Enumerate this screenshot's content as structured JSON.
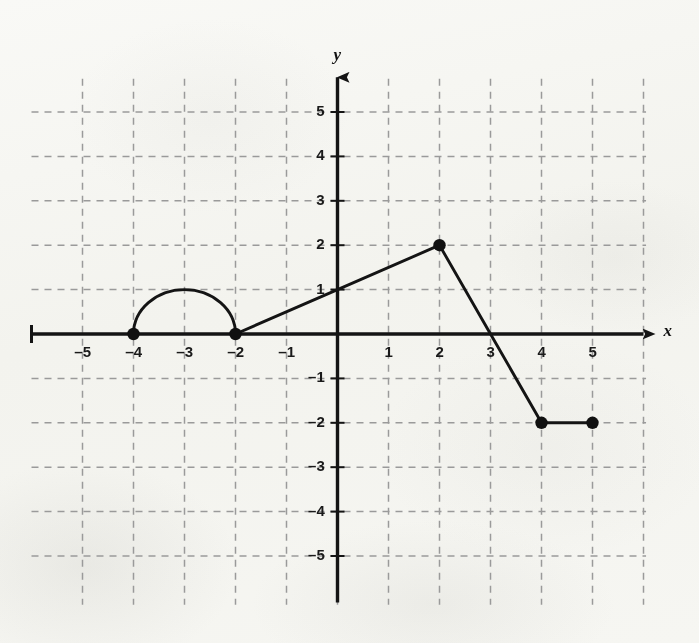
{
  "figure": {
    "background_color": "#fbfbf9",
    "ink_color": "#1a1a1a",
    "grid_color": "#9a9a9a",
    "axis_label_x": "x",
    "axis_label_y": "y"
  },
  "chart_data": {
    "type": "line",
    "title": "",
    "xlabel": "x",
    "ylabel": "y",
    "xlim": [
      -5.7,
      6.2
    ],
    "ylim": [
      -5.6,
      5.9
    ],
    "grid": true,
    "grid_style": "dashed",
    "legend": "none",
    "x_ticks": [
      -5,
      -4,
      -3,
      -2,
      -1,
      1,
      2,
      3,
      4,
      5
    ],
    "x_tick_labels": [
      "–5",
      "–4",
      "–3",
      "–2",
      "–1",
      "1",
      "2",
      "3",
      "4",
      "5"
    ],
    "y_ticks": [
      -5,
      -4,
      -3,
      -2,
      -1,
      1,
      2,
      3,
      4,
      5
    ],
    "y_tick_labels": [
      "–5",
      "–4",
      "–3",
      "–2",
      "–1",
      "1",
      "2",
      "3",
      "4",
      "5"
    ],
    "x_gridlines": [
      -5,
      -4,
      -3,
      -2,
      -1,
      0,
      1,
      2,
      3,
      4,
      5,
      6
    ],
    "y_gridlines": [
      -5,
      -4,
      -3,
      -2,
      -1,
      1,
      2,
      3,
      4,
      5
    ],
    "series": [
      {
        "name": "semicircle-arc",
        "shape": "semicircle",
        "center": [
          -3,
          0
        ],
        "radius": 1,
        "orientation": "upper",
        "from": [
          -4,
          0
        ],
        "to": [
          -2,
          0
        ],
        "peak": [
          -3,
          1
        ]
      },
      {
        "name": "rising-segment",
        "shape": "polyline",
        "points": [
          [
            -2,
            0
          ],
          [
            0,
            1
          ],
          [
            2,
            2
          ]
        ]
      },
      {
        "name": "falling-segment",
        "shape": "polyline",
        "points": [
          [
            2,
            2
          ],
          [
            3,
            0
          ],
          [
            4,
            -2
          ]
        ]
      },
      {
        "name": "constant-segment",
        "shape": "polyline",
        "points": [
          [
            4,
            -2
          ],
          [
            5,
            -2
          ]
        ]
      }
    ],
    "marked_points": [
      {
        "label": "(–4, 0)",
        "x": -4,
        "y": 0,
        "style": "filled"
      },
      {
        "label": "(–2, 0)",
        "x": -2,
        "y": 0,
        "style": "filled"
      },
      {
        "label": "(2, 2)",
        "x": 2,
        "y": 2,
        "style": "filled"
      },
      {
        "label": "(4, –2)",
        "x": 4,
        "y": -2,
        "style": "filled"
      },
      {
        "label": "(5, –2)",
        "x": 5,
        "y": -2,
        "style": "filled"
      }
    ],
    "x_axis_arrow": "right",
    "y_axis_arrow": "up",
    "x_axis_left_endcap": true
  }
}
